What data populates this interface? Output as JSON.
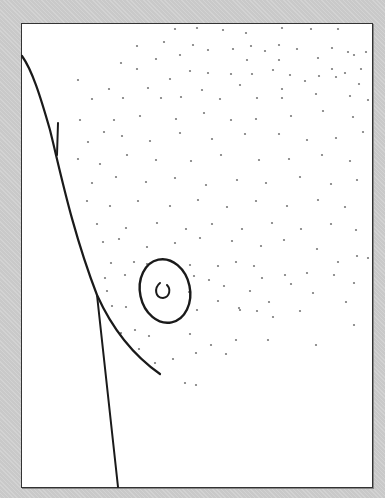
{
  "figure": {
    "colors": {
      "background": "#c9c9c9",
      "panel": "#ffffff",
      "ink": "#1a1a1a",
      "dots": "#777777"
    },
    "dots": [
      [
        175,
        29
      ],
      [
        197,
        28
      ],
      [
        223,
        30
      ],
      [
        246,
        33
      ],
      [
        282,
        28
      ],
      [
        311,
        29
      ],
      [
        338,
        29
      ],
      [
        137,
        46
      ],
      [
        164,
        42
      ],
      [
        193,
        45
      ],
      [
        208,
        50
      ],
      [
        233,
        49
      ],
      [
        251,
        46
      ],
      [
        265,
        51
      ],
      [
        279,
        45
      ],
      [
        297,
        49
      ],
      [
        332,
        48
      ],
      [
        348,
        52
      ],
      [
        366,
        52
      ],
      [
        121,
        63
      ],
      [
        156,
        59
      ],
      [
        180,
        55
      ],
      [
        247,
        60
      ],
      [
        279,
        60
      ],
      [
        318,
        58
      ],
      [
        354,
        55
      ],
      [
        137,
        69
      ],
      [
        190,
        71
      ],
      [
        208,
        73
      ],
      [
        231,
        74
      ],
      [
        252,
        74
      ],
      [
        273,
        70
      ],
      [
        290,
        75
      ],
      [
        332,
        69
      ],
      [
        345,
        73
      ],
      [
        361,
        69
      ],
      [
        78,
        80
      ],
      [
        109,
        89
      ],
      [
        148,
        88
      ],
      [
        170,
        79
      ],
      [
        202,
        90
      ],
      [
        240,
        85
      ],
      [
        282,
        89
      ],
      [
        305,
        81
      ],
      [
        319,
        76
      ],
      [
        336,
        77
      ],
      [
        359,
        84
      ],
      [
        92,
        99
      ],
      [
        123,
        98
      ],
      [
        161,
        98
      ],
      [
        181,
        97
      ],
      [
        220,
        99
      ],
      [
        257,
        98
      ],
      [
        282,
        98
      ],
      [
        316,
        94
      ],
      [
        350,
        96
      ],
      [
        368,
        100
      ],
      [
        80,
        120
      ],
      [
        114,
        120
      ],
      [
        140,
        116
      ],
      [
        176,
        119
      ],
      [
        204,
        113
      ],
      [
        231,
        120
      ],
      [
        256,
        119
      ],
      [
        291,
        116
      ],
      [
        323,
        111
      ],
      [
        353,
        117
      ],
      [
        88,
        142
      ],
      [
        104,
        132
      ],
      [
        122,
        136
      ],
      [
        150,
        141
      ],
      [
        180,
        133
      ],
      [
        212,
        139
      ],
      [
        245,
        134
      ],
      [
        279,
        134
      ],
      [
        307,
        140
      ],
      [
        336,
        138
      ],
      [
        363,
        132
      ],
      [
        78,
        159
      ],
      [
        100,
        164
      ],
      [
        127,
        155
      ],
      [
        156,
        160
      ],
      [
        191,
        161
      ],
      [
        221,
        155
      ],
      [
        259,
        160
      ],
      [
        289,
        159
      ],
      [
        322,
        155
      ],
      [
        350,
        161
      ],
      [
        92,
        183
      ],
      [
        116,
        177
      ],
      [
        146,
        182
      ],
      [
        175,
        178
      ],
      [
        206,
        185
      ],
      [
        237,
        180
      ],
      [
        266,
        183
      ],
      [
        300,
        177
      ],
      [
        331,
        184
      ],
      [
        357,
        180
      ],
      [
        87,
        201
      ],
      [
        110,
        206
      ],
      [
        138,
        201
      ],
      [
        170,
        206
      ],
      [
        198,
        200
      ],
      [
        227,
        207
      ],
      [
        256,
        201
      ],
      [
        287,
        206
      ],
      [
        318,
        200
      ],
      [
        345,
        207
      ],
      [
        97,
        224
      ],
      [
        126,
        228
      ],
      [
        157,
        223
      ],
      [
        186,
        229
      ],
      [
        212,
        224
      ],
      [
        242,
        229
      ],
      [
        272,
        223
      ],
      [
        301,
        229
      ],
      [
        331,
        224
      ],
      [
        356,
        230
      ],
      [
        103,
        242
      ],
      [
        119,
        239
      ],
      [
        147,
        247
      ],
      [
        175,
        243
      ],
      [
        200,
        238
      ],
      [
        232,
        241
      ],
      [
        261,
        246
      ],
      [
        284,
        240
      ],
      [
        317,
        249
      ],
      [
        357,
        256
      ],
      [
        111,
        263
      ],
      [
        134,
        262
      ],
      [
        147,
        264
      ],
      [
        190,
        265
      ],
      [
        218,
        266
      ],
      [
        236,
        262
      ],
      [
        254,
        266
      ],
      [
        285,
        275
      ],
      [
        307,
        273
      ],
      [
        338,
        262
      ],
      [
        368,
        258
      ],
      [
        105,
        278
      ],
      [
        125,
        275
      ],
      [
        194,
        276
      ],
      [
        209,
        280
      ],
      [
        224,
        286
      ],
      [
        250,
        291
      ],
      [
        262,
        278
      ],
      [
        291,
        284
      ],
      [
        313,
        293
      ],
      [
        334,
        275
      ],
      [
        354,
        283
      ],
      [
        107,
        291
      ],
      [
        189,
        292
      ],
      [
        218,
        301
      ],
      [
        239,
        308
      ],
      [
        273,
        317
      ],
      [
        300,
        311
      ],
      [
        346,
        302
      ],
      [
        112,
        306
      ],
      [
        126,
        307
      ],
      [
        197,
        310
      ],
      [
        240,
        310
      ],
      [
        257,
        311
      ],
      [
        269,
        302
      ],
      [
        121,
        333
      ],
      [
        135,
        330
      ],
      [
        149,
        336
      ],
      [
        190,
        334
      ],
      [
        211,
        345
      ],
      [
        236,
        340
      ],
      [
        268,
        340
      ],
      [
        316,
        345
      ],
      [
        354,
        325
      ],
      [
        139,
        349
      ],
      [
        173,
        359
      ],
      [
        196,
        353
      ],
      [
        226,
        354
      ],
      [
        155,
        363
      ],
      [
        185,
        383
      ],
      [
        196,
        385
      ]
    ]
  }
}
